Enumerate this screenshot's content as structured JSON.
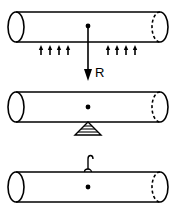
{
  "diagram": {
    "colors": {
      "ink": "#000000",
      "background": "#ffffff"
    },
    "panels": [
      {
        "id": "distributed-load",
        "cylinder": {
          "top": 12,
          "bottom": 42,
          "left": 16,
          "right": 160
        },
        "center_dot": {
          "x": 88,
          "y": 26
        },
        "small_arrows": {
          "direction": "up",
          "x": [
            41,
            50,
            59,
            68,
            108,
            117,
            126,
            135
          ],
          "y_top": 46,
          "y_bottom": 55
        },
        "resultant": {
          "label": "R",
          "direction": "down",
          "x": 88,
          "y_start": 26,
          "y_end": 81
        }
      },
      {
        "id": "point-support",
        "cylinder": {
          "top": 92,
          "bottom": 122,
          "left": 16,
          "right": 160
        },
        "center_dot": {
          "x": 88,
          "y": 107
        },
        "support": {
          "type": "hatched-triangle",
          "apex_y": 122,
          "base_y": 135,
          "half_width": 13
        }
      },
      {
        "id": "hook-suspension",
        "cylinder": {
          "top": 172,
          "bottom": 202,
          "left": 16,
          "right": 160
        },
        "center_dot": {
          "x": 88,
          "y": 187
        },
        "hook": {
          "type": "hook",
          "x": 88,
          "y_base": 172,
          "y_top": 157
        }
      }
    ]
  }
}
